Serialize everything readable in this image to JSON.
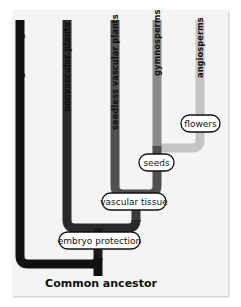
{
  "diagram": {
    "type": "cladogram",
    "title": "",
    "colors": {
      "panel_bg": "#f4f4f2",
      "green_algae": "#1a1a1a",
      "nonvascular_plants": "#2f2f2f",
      "seedless_vascular_plants": "#505050",
      "gymnosperms": "#8a8a8a",
      "angiosperms": "#c4c4c4",
      "label_box_bg": "#ffffff",
      "label_box_border": "#111111"
    },
    "taxa": [
      {
        "id": "green-algae",
        "label": "green algae"
      },
      {
        "id": "nonvascular-plants",
        "label": "nonvascular plants"
      },
      {
        "id": "seedless-vascular-plants",
        "label": "seedless vascular plants"
      },
      {
        "id": "gymnosperms",
        "label": "gymnosperms"
      },
      {
        "id": "angiosperms",
        "label": "angiosperms"
      }
    ],
    "traits": [
      {
        "id": "embryo-protection",
        "label": "embryo protection"
      },
      {
        "id": "vascular-tissue",
        "label": "vascular tissue"
      },
      {
        "id": "seeds",
        "label": "seeds"
      },
      {
        "id": "flowers",
        "label": "flowers"
      }
    ],
    "root": {
      "label": "Common ancestor"
    }
  }
}
